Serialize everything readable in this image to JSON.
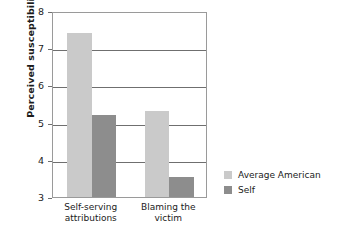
{
  "chart_data": {
    "type": "bar",
    "title": "",
    "xlabel": "",
    "ylabel": "Perceived susceptibility",
    "ylim": [
      3,
      8
    ],
    "yticks": [
      3,
      4,
      5,
      6,
      7,
      8
    ],
    "ytick_labels": [
      "3",
      "4",
      "5",
      "6",
      "7",
      "8"
    ],
    "grid": true,
    "legend_position": "right",
    "categories": [
      "Self-serving\nattributions",
      "Blaming the\nvictim"
    ],
    "series": [
      {
        "name": "Average American",
        "color": "#cacaca",
        "values": [
          7.4,
          5.3
        ]
      },
      {
        "name": "Self",
        "color": "#8d8d8d",
        "values": [
          5.2,
          3.55
        ]
      }
    ]
  },
  "axis": {
    "y_title": "Perceived susceptibility"
  },
  "legend": {
    "items": [
      {
        "label": "Average American",
        "color": "#cacaca"
      },
      {
        "label": "Self",
        "color": "#8d8d8d"
      }
    ]
  }
}
